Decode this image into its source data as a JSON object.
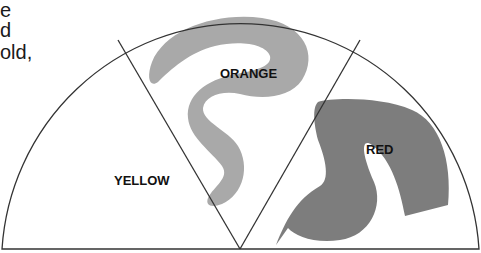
{
  "text_fragments": [
    "e",
    "d",
    "old,"
  ],
  "diagram": {
    "type": "semicircle-segments",
    "segments": [
      {
        "label": "YELLOW",
        "fill": "#ffffff"
      },
      {
        "label": "ORANGE",
        "fill": "#a9a9a9"
      },
      {
        "label": "RED",
        "fill": "#7d7d7d"
      }
    ],
    "stroke_color": "#333333"
  }
}
